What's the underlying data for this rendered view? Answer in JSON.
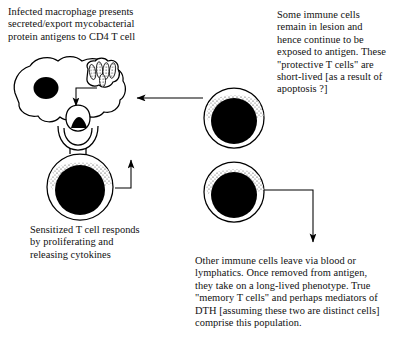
{
  "diagram": {
    "background_color": "#ffffff",
    "ink_color": "#000000"
  },
  "captions": {
    "macrophage": "Infected macrophage presents\nsecreted/export mycobacterial\nprotein antigens to CD4 T cell",
    "protective": "Some immune cells\nremain in lesion  and\nhence continue to be\nexposed to antigen. These\n\"protective T cells\" are\nshort-lived [as a result of\napoptosis ?]",
    "sensitized": "Sensitized T cell responds\nby proliferating and\nreleasing cytokines",
    "memory": "Other immune cells leave via blood or\nlymphatics. Once removed from antigen,\nthey take on a long-lived phenotype. True\n\"memory T cells\" and perhaps mediators of\nDTH [assuming these two are distinct cells]\ncomprise this population."
  },
  "figures": {
    "macrophage": {
      "label": "infected macrophage",
      "nucleus": "nucleus",
      "phagosome": "phagosome with mycobacteria",
      "bacilli_count": 5
    },
    "mhc_complex": {
      "label": "antigen / MHC presentation complex"
    },
    "sensitized_t_cell": {
      "label": "sensitized CD4 T cell"
    },
    "protective_t_cell": {
      "label": "protective T cell remaining in lesion"
    },
    "memory_t_cell": {
      "label": "memory T cell leaving via blood or lymphatics"
    }
  },
  "arrows": {
    "antigen_to_mhc": "antigen transport from phagosome to cell surface",
    "protective_to_macrophage": "protective T cells re-exposed to antigen",
    "sensitized_to_protective": "sensitized T cell becomes protective T cell",
    "memory_to_caption": "memory T cell population"
  }
}
